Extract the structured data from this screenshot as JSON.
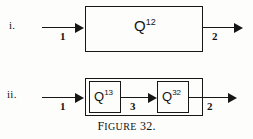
{
  "figure": {
    "caption_lead": "F",
    "caption_small": "IGURE",
    "caption_number": "32.",
    "caption_full": "FIGURE 32."
  },
  "diagrams": [
    {
      "row_label": "i.",
      "blocks": [
        {
          "base": "Q",
          "superscript": "12"
        }
      ],
      "arrows": [
        {
          "name": "input",
          "label": "1"
        },
        {
          "name": "output",
          "label": "2"
        }
      ]
    },
    {
      "row_label": "ii.",
      "blocks": [
        {
          "base": "Q",
          "superscript": "13"
        },
        {
          "base": "Q",
          "superscript": "32"
        }
      ],
      "arrows": [
        {
          "name": "input",
          "label": "1"
        },
        {
          "name": "middle",
          "label": "3"
        },
        {
          "name": "output",
          "label": "2"
        }
      ]
    }
  ],
  "colors": {
    "ink": "#161616",
    "background": "#fdfdfc"
  }
}
